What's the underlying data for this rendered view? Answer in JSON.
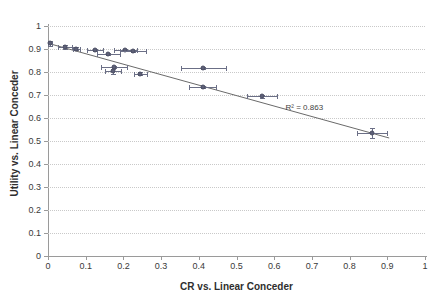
{
  "chart_data": {
    "type": "scatter",
    "title": "",
    "xlabel": "CR vs. Linear Conceder",
    "ylabel": "Utility vs. Linear Conceder",
    "xlim": [
      0,
      1
    ],
    "ylim": [
      0,
      1
    ],
    "grid": true,
    "legend": null,
    "x_ticks": [
      "0",
      "0.1",
      "0.2",
      "0.3",
      "0.4",
      "0.5",
      "0.6",
      "0.7",
      "0.8",
      "0.9",
      "1"
    ],
    "x_tick_values": [
      0,
      0.1,
      0.2,
      0.3,
      0.4,
      0.5,
      0.6,
      0.7,
      0.8,
      0.9,
      1
    ],
    "y_ticks": [
      "0",
      "0.1",
      "0.2",
      "0.3",
      "0.4",
      "0.5",
      "0.6",
      "0.7",
      "0.8",
      "0.9",
      "1"
    ],
    "y_tick_values": [
      0,
      0.1,
      0.2,
      0.3,
      0.4,
      0.5,
      0.6,
      0.7,
      0.8,
      0.9,
      1
    ],
    "annotations": [
      {
        "text": "R² = 0.863",
        "x": 0.63,
        "y": 0.645
      }
    ],
    "trendline": {
      "type": "linear",
      "x_start": 0.0,
      "y_start": 0.925,
      "x_end": 0.905,
      "y_end": 0.513,
      "r_squared": 0.863
    },
    "points": [
      {
        "x": 0.005,
        "y": 0.925,
        "xerr": 0.005,
        "yerr": 0.012
      },
      {
        "x": 0.045,
        "y": 0.91,
        "xerr": 0.018,
        "yerr": 0.008
      },
      {
        "x": 0.075,
        "y": 0.902,
        "xerr": 0.01,
        "yerr": 0.006
      },
      {
        "x": 0.125,
        "y": 0.896,
        "xerr": 0.022,
        "yerr": 0.005
      },
      {
        "x": 0.16,
        "y": 0.879,
        "xerr": 0.03,
        "yerr": 0.005
      },
      {
        "x": 0.205,
        "y": 0.897,
        "xerr": 0.03,
        "yerr": 0.004
      },
      {
        "x": 0.225,
        "y": 0.893,
        "xerr": 0.035,
        "yerr": 0.004
      },
      {
        "x": 0.175,
        "y": 0.823,
        "xerr": 0.035,
        "yerr": 0.004
      },
      {
        "x": 0.172,
        "y": 0.803,
        "xerr": 0.022,
        "yerr": 0.01
      },
      {
        "x": 0.245,
        "y": 0.793,
        "xerr": 0.018,
        "yerr": 0.008
      },
      {
        "x": 0.412,
        "y": 0.818,
        "xerr": 0.06,
        "yerr": 0.005
      },
      {
        "x": 0.41,
        "y": 0.735,
        "xerr": 0.035,
        "yerr": 0.004
      },
      {
        "x": 0.568,
        "y": 0.695,
        "xerr": 0.04,
        "yerr": 0.006
      },
      {
        "x": 0.86,
        "y": 0.535,
        "xerr": 0.04,
        "yerr": 0.022
      }
    ]
  },
  "colors": {
    "marker": "#5d6078",
    "errorbar": "#6b6f86",
    "trendline": "#6a6a6a",
    "gridline": "#c9c9c9",
    "axis": "#9a9a9a",
    "text": "#3a3a3a",
    "background": "#ffffff"
  }
}
